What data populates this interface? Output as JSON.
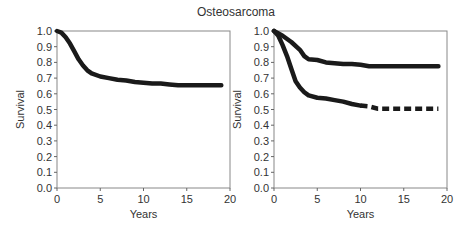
{
  "figure": {
    "title": "Osteosarcoma"
  },
  "chart_data": [
    {
      "type": "line",
      "title": "",
      "xlabel": "Years",
      "ylabel": "Survival",
      "xlim": [
        0,
        20
      ],
      "ylim": [
        0,
        1.0
      ],
      "xticks": [
        "0",
        "5",
        "10",
        "15",
        "20"
      ],
      "yticks": [
        "0.0",
        "0.1",
        "0.2",
        "0.3",
        "0.4",
        "0.5",
        "0.6",
        "0.7",
        "0.8",
        "0.9",
        "1.0"
      ],
      "grid": false,
      "series": [
        {
          "name": "Overall",
          "style": "solid",
          "x": [
            0,
            0.5,
            1,
            1.5,
            2,
            2.5,
            3,
            3.5,
            4,
            5,
            6,
            7,
            8,
            9,
            10,
            11,
            12,
            13,
            14,
            15,
            17,
            19
          ],
          "y": [
            1.0,
            0.99,
            0.96,
            0.92,
            0.87,
            0.82,
            0.78,
            0.75,
            0.73,
            0.71,
            0.7,
            0.69,
            0.685,
            0.675,
            0.67,
            0.665,
            0.665,
            0.66,
            0.655,
            0.655,
            0.655,
            0.655
          ]
        }
      ]
    },
    {
      "type": "line",
      "title": "",
      "xlabel": "Years",
      "ylabel": "Survival",
      "xlim": [
        0,
        20
      ],
      "ylim": [
        0,
        1.0
      ],
      "xticks": [
        "0",
        "5",
        "10",
        "15",
        "20"
      ],
      "yticks": [
        "0.0",
        "0.1",
        "0.2",
        "0.3",
        "0.4",
        "0.5",
        "0.6",
        "0.7",
        "0.8",
        "0.9",
        "1.0"
      ],
      "grid": false,
      "series": [
        {
          "name": "Group A",
          "style": "solid",
          "x": [
            0,
            1,
            2,
            3,
            3.5,
            4,
            5,
            6,
            7,
            8,
            9,
            10,
            11,
            12,
            14,
            16,
            19
          ],
          "y": [
            1.0,
            0.97,
            0.93,
            0.88,
            0.84,
            0.82,
            0.815,
            0.8,
            0.795,
            0.79,
            0.79,
            0.785,
            0.775,
            0.775,
            0.775,
            0.775,
            0.775
          ]
        },
        {
          "name": "Group B",
          "style": "solid-then-dashed",
          "x": [
            0,
            0.5,
            1,
            1.5,
            2,
            2.5,
            3,
            3.5,
            4,
            5,
            6,
            7,
            8,
            9,
            10,
            11,
            12,
            14,
            16,
            19
          ],
          "y": [
            1.0,
            0.97,
            0.91,
            0.84,
            0.76,
            0.68,
            0.64,
            0.61,
            0.59,
            0.575,
            0.57,
            0.56,
            0.55,
            0.535,
            0.525,
            0.52,
            0.505,
            0.505,
            0.505,
            0.505
          ],
          "dashed_from_x": 10
        }
      ]
    }
  ]
}
